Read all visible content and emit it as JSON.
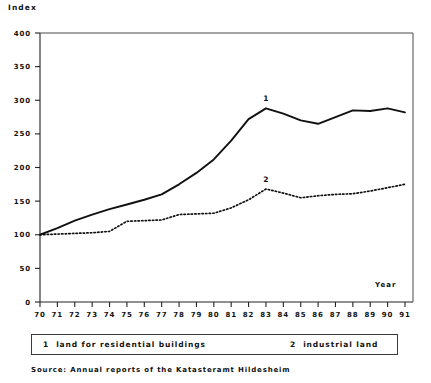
{
  "chart_data": {
    "type": "line",
    "title": "",
    "xlabel": "Year",
    "ylabel": "Index",
    "xlim": [
      70,
      91
    ],
    "ylim": [
      0,
      400
    ],
    "ytick_step": 50,
    "grid": false,
    "legend_position": "bottom",
    "x": [
      70,
      71,
      72,
      73,
      74,
      75,
      76,
      77,
      78,
      79,
      80,
      81,
      82,
      83,
      84,
      85,
      86,
      87,
      88,
      89,
      90,
      91
    ],
    "xticklabels": [
      "70",
      "71",
      "72",
      "73",
      "74",
      "75",
      "76",
      "77",
      "78",
      "79",
      "80",
      "81",
      "82",
      "83",
      "84",
      "85",
      "86",
      "87",
      "88",
      "89",
      "90",
      "91"
    ],
    "yticklabels": [
      "0",
      "50",
      "100",
      "150",
      "200",
      "250",
      "300",
      "350",
      "400"
    ],
    "yticks": [
      0,
      50,
      100,
      150,
      200,
      250,
      300,
      350,
      400
    ],
    "series": [
      {
        "name": "land for residential buildings",
        "key": "1",
        "style": "solid",
        "color": "#111111",
        "marker_label": "1",
        "marker_at_x": 83,
        "values": [
          100,
          110,
          121,
          130,
          138,
          145,
          152,
          160,
          175,
          192,
          212,
          240,
          272,
          288,
          280,
          270,
          265,
          275,
          285,
          284,
          288,
          282
        ]
      },
      {
        "name": "industrial land",
        "key": "2",
        "style": "dotted",
        "color": "#111111",
        "marker_label": "2",
        "marker_at_x": 83,
        "values": [
          100,
          101,
          102,
          103,
          105,
          120,
          121,
          122,
          130,
          131,
          132,
          140,
          152,
          168,
          162,
          155,
          158,
          160,
          161,
          165,
          170,
          175
        ]
      }
    ]
  },
  "labels": {
    "y_axis_title": "Index",
    "x_axis_title": "Year"
  },
  "legend": {
    "entries": [
      {
        "key": "1",
        "label": "land for residential buildings"
      },
      {
        "key": "2",
        "label": "industrial land"
      }
    ]
  },
  "source": {
    "text": "Source: Annual reports of the Katasteramt Hildesheim"
  }
}
